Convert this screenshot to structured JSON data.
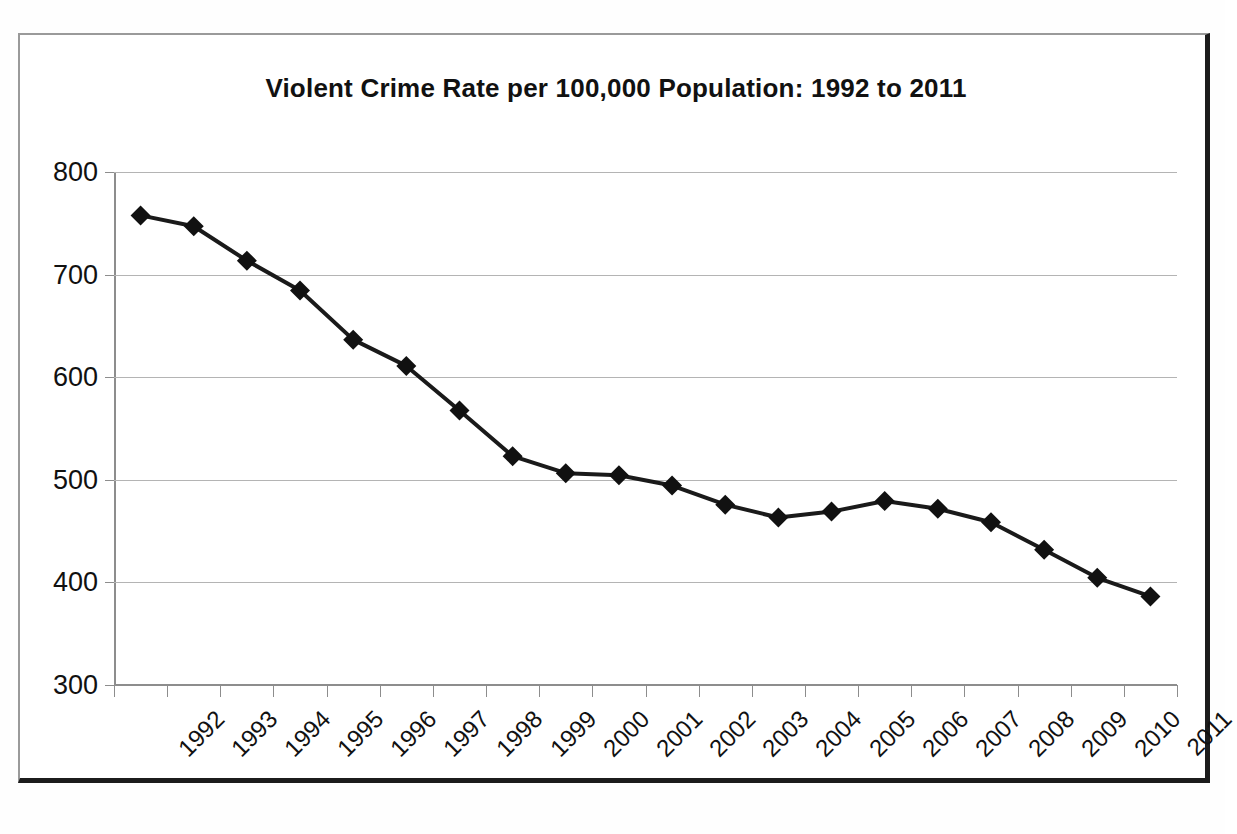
{
  "chart_data": {
    "type": "line",
    "title": "Violent Crime Rate per 100,000 Population: 1992 to 2011",
    "xlabel": "",
    "ylabel": "",
    "categories": [
      "1992",
      "1993",
      "1994",
      "1995",
      "1996",
      "1997",
      "1998",
      "1999",
      "2000",
      "2001",
      "2002",
      "2003",
      "2004",
      "2005",
      "2006",
      "2007",
      "2008",
      "2009",
      "2010",
      "2011"
    ],
    "values": [
      757.7,
      747.1,
      713.6,
      684.5,
      636.6,
      611.0,
      567.6,
      523.0,
      506.5,
      504.5,
      494.4,
      475.8,
      463.2,
      469.0,
      479.3,
      471.8,
      458.6,
      431.9,
      404.5,
      386.3
    ],
    "series": [
      {
        "name": "Violent Crime Rate",
        "values": [
          757.7,
          747.1,
          713.6,
          684.5,
          636.6,
          611.0,
          567.6,
          523.0,
          506.5,
          504.5,
          494.4,
          475.8,
          463.2,
          469.0,
          479.3,
          471.8,
          458.6,
          431.9,
          404.5,
          386.3
        ],
        "color": "#1a1a1a",
        "marker": "diamond"
      }
    ],
    "ylim": [
      300,
      800
    ],
    "yticks": [
      300,
      400,
      500,
      600,
      700,
      800
    ],
    "ytick_labels": [
      "300",
      "400",
      "500",
      "600",
      "700",
      "800"
    ],
    "grid": true,
    "legend": "none",
    "line_color": "#1a1a1a",
    "marker_color": "#111111",
    "gridline_color": "#b4b4b4",
    "background_color": "#ffffff",
    "frame_color": "#1c1c1c"
  }
}
